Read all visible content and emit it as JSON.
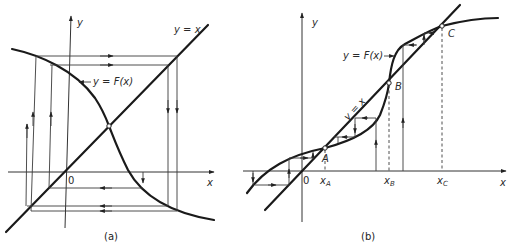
{
  "figure": {
    "panels": [
      {
        "id": "a",
        "caption": "(a)",
        "axis_x_label": "x",
        "axis_y_label": "y",
        "origin_label": "0",
        "line_label": "y = x",
        "curve_label": "y = F(x)",
        "description": "Decreasing function F(x) crossing y = x at a single fixed point; cobweb iteration spirals outward"
      },
      {
        "id": "b",
        "caption": "(b)",
        "axis_x_label": "x",
        "axis_y_label": "y",
        "origin_label": "0",
        "line_label": "y = x",
        "curve_label": "y = F(x)",
        "fixed_points": [
          {
            "name": "A",
            "x_label": "x",
            "x_sub": "A"
          },
          {
            "name": "B",
            "x_label": "x",
            "x_sub": "B"
          },
          {
            "name": "C",
            "x_label": "x",
            "x_sub": "C"
          }
        ],
        "description": "Increasing S-shaped F(x) crossing y = x at three fixed points A, B, C; staircase iterations converge to A or C"
      }
    ],
    "colors": {
      "ink": "#1a1a1a",
      "background": "#ffffff"
    }
  }
}
